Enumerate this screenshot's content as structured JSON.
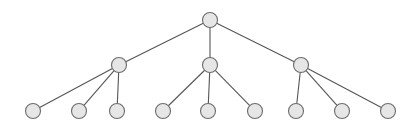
{
  "figure": {
    "title": "",
    "type": "tree-diagram",
    "width": 416,
    "height": 130,
    "background_color": "#ffffff"
  },
  "style": {
    "node_fill": "#e6e6e6",
    "node_stroke": "#6b6b6b",
    "node_stroke_width": 1.1,
    "node_radius": 7.5,
    "edge_stroke": "#555555",
    "edge_stroke_width": 1.1
  },
  "chart_data": {
    "type": "tree",
    "title": "",
    "levels": 3,
    "node_count": 13,
    "edge_count": 12,
    "branching": "1 root -> 3 internal -> 3 leaves each",
    "nodes": [
      {
        "id": "root",
        "label": "",
        "level": 0,
        "x": 210,
        "y": 20,
        "parent": null
      },
      {
        "id": "n1",
        "label": "",
        "level": 1,
        "x": 119,
        "y": 65,
        "parent": "root"
      },
      {
        "id": "n2",
        "label": "",
        "level": 1,
        "x": 210,
        "y": 65,
        "parent": "root"
      },
      {
        "id": "n3",
        "label": "",
        "level": 1,
        "x": 301,
        "y": 65,
        "parent": "root"
      },
      {
        "id": "l1",
        "label": "",
        "level": 2,
        "x": 33,
        "y": 111,
        "parent": "n1"
      },
      {
        "id": "l2",
        "label": "",
        "level": 2,
        "x": 79,
        "y": 111,
        "parent": "n1"
      },
      {
        "id": "l3",
        "label": "",
        "level": 2,
        "x": 117,
        "y": 111,
        "parent": "n1"
      },
      {
        "id": "l4",
        "label": "",
        "level": 2,
        "x": 163,
        "y": 111,
        "parent": "n2"
      },
      {
        "id": "l5",
        "label": "",
        "level": 2,
        "x": 208,
        "y": 111,
        "parent": "n2"
      },
      {
        "id": "l6",
        "label": "",
        "level": 2,
        "x": 255,
        "y": 111,
        "parent": "n2"
      },
      {
        "id": "l7",
        "label": "",
        "level": 2,
        "x": 296,
        "y": 111,
        "parent": "n3"
      },
      {
        "id": "l8",
        "label": "",
        "level": 2,
        "x": 342,
        "y": 111,
        "parent": "n3"
      },
      {
        "id": "l9",
        "label": "",
        "level": 2,
        "x": 388,
        "y": 111,
        "parent": "n3"
      }
    ],
    "edges": [
      {
        "from": "root",
        "to": "n1"
      },
      {
        "from": "root",
        "to": "n2"
      },
      {
        "from": "root",
        "to": "n3"
      },
      {
        "from": "n1",
        "to": "l1"
      },
      {
        "from": "n1",
        "to": "l2"
      },
      {
        "from": "n1",
        "to": "l3"
      },
      {
        "from": "n2",
        "to": "l4"
      },
      {
        "from": "n2",
        "to": "l5"
      },
      {
        "from": "n2",
        "to": "l6"
      },
      {
        "from": "n3",
        "to": "l7"
      },
      {
        "from": "n3",
        "to": "l8"
      },
      {
        "from": "n3",
        "to": "l9"
      }
    ]
  }
}
